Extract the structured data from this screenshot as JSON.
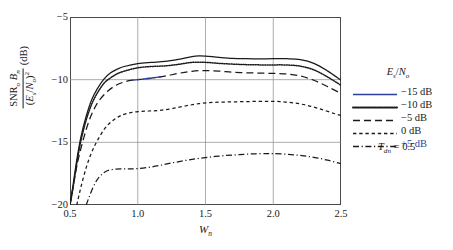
{
  "chart_data": {
    "type": "line",
    "title": "",
    "xlabel": "Wn",
    "ylabel": "SNR_o * B_n / (E_s/N_o)^2 (dB)",
    "xlim": [
      0.5,
      2.5
    ],
    "ylim": [
      -20,
      -5
    ],
    "xticks": [
      0.5,
      1.0,
      1.5,
      2.0,
      2.5
    ],
    "xticklabels": [
      "0.5",
      "1.0",
      "1.5",
      "2.0",
      "2.5"
    ],
    "yticks": [
      -5,
      -10,
      -15,
      -20
    ],
    "yticklabels": [
      "−5",
      "−10",
      "−15",
      "−20"
    ],
    "grid": true,
    "legend_position": "right-outside",
    "legend_title": "Es/No",
    "annotation": "Tdn = 0.5",
    "series": [
      {
        "name": "−15 dB",
        "style": "solid",
        "color": "#1a1a1a",
        "x": [
          0.5,
          0.52,
          0.55,
          0.58,
          0.62,
          0.66,
          0.7,
          0.75,
          0.8,
          0.85,
          0.9,
          1.0,
          1.1,
          1.2,
          1.3,
          1.4,
          1.45,
          1.5,
          1.6,
          1.7,
          1.8,
          1.9,
          2.0,
          2.1,
          2.2,
          2.3,
          2.4,
          2.5
        ],
        "y": [
          -20.0,
          -18.6,
          -16.4,
          -14.6,
          -12.9,
          -11.6,
          -10.75,
          -9.95,
          -9.45,
          -9.15,
          -8.95,
          -8.72,
          -8.62,
          -8.55,
          -8.38,
          -8.16,
          -8.1,
          -8.12,
          -8.22,
          -8.3,
          -8.33,
          -8.34,
          -8.33,
          -8.33,
          -8.4,
          -8.7,
          -9.3,
          -10.05
        ]
      },
      {
        "name": "−10 dB",
        "style": "dotted",
        "color": "#1a1a1a",
        "x": [
          0.5,
          0.52,
          0.55,
          0.58,
          0.62,
          0.66,
          0.7,
          0.75,
          0.8,
          0.85,
          0.9,
          1.0,
          1.1,
          1.2,
          1.3,
          1.4,
          1.5,
          1.6,
          1.7,
          1.8,
          1.9,
          2.0,
          2.1,
          2.2,
          2.3,
          2.4,
          2.5
        ],
        "y": [
          -20.0,
          -18.8,
          -16.7,
          -14.9,
          -13.2,
          -11.95,
          -11.1,
          -10.3,
          -9.85,
          -9.52,
          -9.32,
          -9.05,
          -8.95,
          -8.9,
          -8.78,
          -8.62,
          -8.62,
          -8.7,
          -8.76,
          -8.8,
          -8.82,
          -8.82,
          -8.83,
          -8.92,
          -9.22,
          -9.78,
          -10.45
        ]
      },
      {
        "name": "−5 dB",
        "style": "dashed-long",
        "color": "#1a1a1a",
        "highlight_color": "#2b3fa0",
        "x": [
          0.5,
          0.53,
          0.56,
          0.6,
          0.64,
          0.68,
          0.72,
          0.78,
          0.84,
          0.9,
          0.96,
          1.0,
          1.1,
          1.2,
          1.3,
          1.4,
          1.5,
          1.6,
          1.7,
          1.8,
          1.9,
          2.0,
          2.1,
          2.2,
          2.3,
          2.4,
          2.5
        ],
        "y": [
          -20.0,
          -18.1,
          -16.4,
          -14.7,
          -13.3,
          -12.3,
          -11.6,
          -10.9,
          -10.45,
          -10.18,
          -10.04,
          -10.0,
          -9.88,
          -9.72,
          -9.5,
          -9.33,
          -9.27,
          -9.32,
          -9.4,
          -9.45,
          -9.48,
          -9.5,
          -9.55,
          -9.7,
          -10.05,
          -10.55,
          -11.1
        ]
      },
      {
        "name": "0 dB",
        "style": "dashed-short",
        "color": "#1a1a1a",
        "x": [
          0.55,
          0.58,
          0.62,
          0.66,
          0.7,
          0.75,
          0.8,
          0.86,
          0.92,
          1.0,
          1.08,
          1.16,
          1.25,
          1.35,
          1.45,
          1.55,
          1.65,
          1.75,
          1.85,
          1.95,
          2.05,
          2.15,
          2.25,
          2.35,
          2.45,
          2.5
        ],
        "y": [
          -20.0,
          -18.6,
          -17.0,
          -15.8,
          -14.9,
          -14.0,
          -13.4,
          -12.95,
          -12.7,
          -12.55,
          -12.5,
          -12.45,
          -12.32,
          -12.1,
          -11.92,
          -11.82,
          -11.78,
          -11.76,
          -11.74,
          -11.73,
          -11.75,
          -11.85,
          -12.05,
          -12.35,
          -12.7,
          -12.85
        ]
      },
      {
        "name": "+5 dB",
        "style": "dash-dot",
        "color": "#1a1a1a",
        "x": [
          0.62,
          0.64,
          0.67,
          0.7,
          0.74,
          0.78,
          0.83,
          0.88,
          0.94,
          1.0,
          1.08,
          1.16,
          1.25,
          1.35,
          1.45,
          1.55,
          1.65,
          1.75,
          1.85,
          1.95,
          2.0,
          2.1,
          2.2,
          2.3,
          2.4,
          2.5
        ],
        "y": [
          -20.0,
          -19.4,
          -18.6,
          -18.0,
          -17.5,
          -17.25,
          -17.15,
          -17.12,
          -17.12,
          -17.1,
          -17.0,
          -16.85,
          -16.65,
          -16.45,
          -16.28,
          -16.15,
          -16.05,
          -15.98,
          -15.92,
          -15.9,
          -15.9,
          -15.95,
          -16.05,
          -16.2,
          -16.42,
          -16.7
        ]
      }
    ]
  },
  "axes": {
    "y_label_numerator_snr": "SNR",
    "y_label_numerator_sub_o": "o",
    "y_label_numerator_b": "B",
    "y_label_numerator_sub_n": "n",
    "y_label_denominator_open": "(",
    "y_label_denominator_es": "E",
    "y_label_denominator_sub_s": "s",
    "y_label_denominator_slash": "/",
    "y_label_denominator_no": "N",
    "y_label_denominator_sub_o": "o",
    "y_label_denominator_close": ")",
    "y_label_denominator_sup": "2",
    "y_label_unit": "(dB)",
    "x_label_w": "W",
    "x_label_sub_n": "n",
    "yticks": [
      "−5",
      "−10",
      "−15",
      "−20"
    ],
    "xticks": [
      "0.5",
      "1.0",
      "1.5",
      "2.0",
      "2.5"
    ]
  },
  "legend": {
    "title_e": "E",
    "title_sub_s": "s",
    "title_slash": "/",
    "title_n": "N",
    "title_sub_o": "o",
    "items": [
      {
        "label": "−15 dB",
        "style": "solid"
      },
      {
        "label": "−10 dB",
        "style": "dotted"
      },
      {
        "label": "−5 dB",
        "style": "dashed-long"
      },
      {
        "label": "0 dB",
        "style": "dashed-short"
      },
      {
        "label": "+5 dB",
        "style": "dash-dot"
      }
    ]
  },
  "annotation": {
    "t": "T",
    "sub": "dn",
    "value": "= 0.5"
  },
  "colors": {
    "line": "#1a1a1a",
    "grid": "#8a8a8a",
    "frame": "#4a4a4a",
    "accent_blue": "#2b3fa0",
    "accent_red": "#a03030"
  }
}
